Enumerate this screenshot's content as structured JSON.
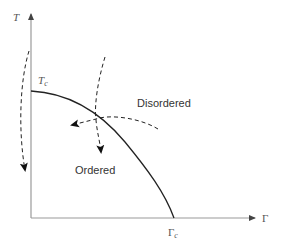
{
  "diagram": {
    "type": "phase-diagram",
    "axes": {
      "y_label": "T",
      "x_label": "Γ"
    },
    "critical_points": {
      "temperature": {
        "symbol": "T",
        "subscript": "c"
      },
      "parameter": {
        "symbol": "Γ",
        "subscript": "c"
      }
    },
    "regions": {
      "disordered": "Disordered",
      "ordered": "Ordered"
    },
    "colors": {
      "axis": "#999999",
      "boundary": "#222222",
      "dashed_arrow": "#222222",
      "text": "#333333"
    }
  }
}
